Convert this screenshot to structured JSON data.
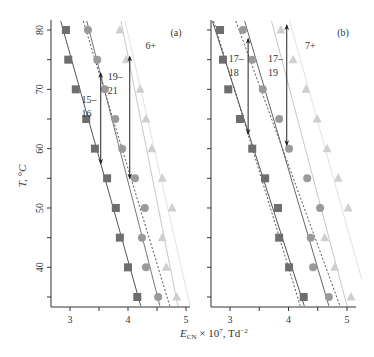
{
  "figure": {
    "y_axis_label": "T, °C",
    "x_axis_label_main": "E",
    "x_axis_label_sub": "CN",
    "x_axis_label_rest": " × 10",
    "x_axis_label_exp": "7",
    "x_axis_label_unit": ", Td",
    "x_axis_label_unit_exp": "−2"
  },
  "chart_data": [
    {
      "type": "scatter",
      "panel_label": "(a)",
      "charge_label": "6+",
      "xlabel": "E_CN × 10^7, Td^-2",
      "ylabel": "T, °C",
      "xlim": [
        2.65,
        5.2
      ],
      "ylim": [
        33.5,
        82
      ],
      "xticks": [
        3,
        3.5,
        4,
        4.5,
        5
      ],
      "xticklabels": [
        "3",
        "",
        "4",
        "",
        "5"
      ],
      "yticks": [
        35,
        40,
        45,
        50,
        55,
        60,
        65,
        70,
        75,
        80
      ],
      "yticklabels": [
        "",
        "40",
        "",
        "50",
        "",
        "60",
        "",
        "70",
        "",
        "80"
      ],
      "grid": false,
      "T": [
        80,
        75,
        70,
        65,
        60,
        55,
        50,
        45,
        40,
        35
      ],
      "series": [
        {
          "name": "squares",
          "marker": "square",
          "color": "#6e6e6e",
          "values": [
            2.93,
            2.97,
            3.1,
            3.28,
            3.43,
            3.64,
            3.79,
            3.86,
            4.0,
            4.16
          ]
        },
        {
          "name": "circles",
          "marker": "circle",
          "color": "#9a9a9a",
          "values": [
            3.31,
            3.47,
            3.6,
            3.78,
            3.9,
            4.12,
            4.29,
            4.24,
            4.31,
            4.52
          ]
        },
        {
          "name": "triangles",
          "marker": "triangle",
          "color": "#cfcfcf",
          "values": [
            3.86,
            3.97,
            4.21,
            4.31,
            4.41,
            4.59,
            4.76,
            4.59,
            4.66,
            4.84
          ]
        }
      ],
      "fit_lines": [
        {
          "style": "solid",
          "color": "#555555",
          "from": [
            2.84,
            81.5
          ],
          "to": [
            4.22,
            33.5
          ]
        },
        {
          "style": "solid",
          "color": "#777777",
          "from": [
            3.29,
            81.5
          ],
          "to": [
            4.55,
            33.5
          ]
        },
        {
          "style": "dashed",
          "color": "#555555",
          "from": [
            3.23,
            81.5
          ],
          "to": [
            4.72,
            33.5
          ]
        },
        {
          "style": "solid",
          "color": "#c8c8c8",
          "from": [
            3.88,
            81.5
          ],
          "to": [
            4.86,
            33.5
          ]
        },
        {
          "style": "solid",
          "color": "#e2e2e2",
          "from": [
            3.95,
            81.5
          ],
          "to": [
            5.07,
            33.5
          ]
        }
      ],
      "annotations": [
        {
          "text_lines": [
            "15–",
            "16"
          ],
          "arrow_x": 3.53,
          "arrow_T": [
            72.7,
            57.5
          ],
          "text_x": 3.2,
          "text_T": 67.7
        },
        {
          "text_lines": [
            "19–",
            "21"
          ],
          "arrow_x": 4.03,
          "arrow_T": [
            75.5,
            55.0
          ],
          "text_x": 3.65,
          "text_T": 71.5
        }
      ]
    },
    {
      "type": "scatter",
      "panel_label": "(b)",
      "charge_label": "7+",
      "xlabel": "E_CN × 10^7, Td^-2",
      "ylabel": "T, °C",
      "xlim": [
        2.65,
        5.2
      ],
      "ylim": [
        33.5,
        82
      ],
      "xticks": [
        3,
        3.5,
        4,
        4.5,
        5
      ],
      "xticklabels": [
        "3",
        "",
        "4",
        "",
        "5"
      ],
      "yticks": [
        35,
        40,
        45,
        50,
        55,
        60,
        65,
        70,
        75,
        80
      ],
      "yticklabels": [
        "",
        "",
        "",
        "",
        "",
        "",
        "",
        "",
        "",
        ""
      ],
      "grid": false,
      "T": [
        80,
        75,
        70,
        65,
        60,
        55,
        50,
        45,
        40,
        35
      ],
      "series": [
        {
          "name": "squares",
          "marker": "square",
          "color": "#6e6e6e",
          "values": [
            2.83,
            2.88,
            2.97,
            3.17,
            3.38,
            3.6,
            3.82,
            3.84,
            4.01,
            4.26
          ]
        },
        {
          "name": "circles",
          "marker": "circle",
          "color": "#9a9a9a",
          "values": [
            3.22,
            3.38,
            3.56,
            3.84,
            4.01,
            4.32,
            4.54,
            4.38,
            4.42,
            4.69
          ]
        },
        {
          "name": "triangles",
          "marker": "triangle",
          "color": "#cfcfcf",
          "values": [
            3.87,
            4.08,
            4.3,
            4.49,
            4.66,
            4.85,
            5.02,
            4.62,
            4.79,
            5.07
          ]
        }
      ],
      "fit_lines": [
        {
          "style": "solid",
          "color": "#555555",
          "from": [
            2.7,
            81.5
          ],
          "to": [
            4.27,
            33.5
          ]
        },
        {
          "style": "dashed",
          "color": "#555555",
          "from": [
            2.72,
            81.5
          ],
          "to": [
            4.2,
            33.5
          ]
        },
        {
          "style": "dashed",
          "color": "#555555",
          "from": [
            3.1,
            81.5
          ],
          "to": [
            4.88,
            33.5
          ]
        },
        {
          "style": "solid",
          "color": "#666666",
          "from": [
            3.25,
            81.5
          ],
          "to": [
            4.69,
            33.5
          ]
        },
        {
          "style": "solid",
          "color": "#c8c8c8",
          "from": [
            3.71,
            81.5
          ],
          "to": [
            5.0,
            33.5
          ]
        },
        {
          "style": "solid",
          "color": "#e2e2e2",
          "from": [
            4.02,
            81.5
          ],
          "to": [
            5.25,
            38.0
          ]
        }
      ],
      "annotations": [
        {
          "text_lines": [
            "17–",
            "18"
          ],
          "arrow_x": 3.31,
          "arrow_T": [
            78.5,
            62.5
          ],
          "text_x": 2.98,
          "text_T": 74.6
        },
        {
          "text_lines": [
            "17–",
            "19"
          ],
          "arrow_x": 3.97,
          "arrow_T": [
            80.8,
            60.6
          ],
          "text_x": 3.65,
          "text_T": 74.6
        }
      ]
    }
  ]
}
